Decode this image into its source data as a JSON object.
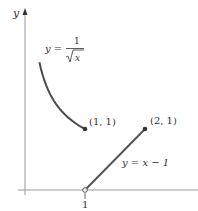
{
  "chart_data": {
    "type": "line",
    "title": "",
    "xlabel": "",
    "ylabel": "y",
    "x_ticks": [
      "1"
    ],
    "series": [
      {
        "name": "y = 1/sqrt(x)",
        "label_lhs": "y =",
        "label_num": "1",
        "label_den": "x",
        "domain": [
          0.24,
          1
        ],
        "endpoint": {
          "x": 1,
          "y": 1,
          "closed": true
        }
      },
      {
        "name": "y = x - 1",
        "label": "y = x − 1",
        "domain": [
          1,
          2
        ],
        "start": {
          "x": 1,
          "y": 0,
          "closed": false
        },
        "endpoint": {
          "x": 2,
          "y": 1,
          "closed": true
        }
      }
    ],
    "annotations": [
      {
        "text": "(1, 1)",
        "x": 1,
        "y": 1
      },
      {
        "text": "(2, 1)",
        "x": 2,
        "y": 1
      }
    ],
    "colors": {
      "curve": "#4a4a4a",
      "line": "#555555",
      "axis": "#999999"
    }
  }
}
